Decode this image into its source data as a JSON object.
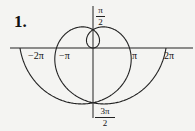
{
  "problem_number": "1.",
  "diagram": {
    "type": "polar-curve",
    "curve": "r = theta",
    "theta_range": [
      "-2π",
      "2π"
    ],
    "axes": {
      "horizontal_labels": [
        "−2π",
        "−π",
        "π",
        "2π"
      ],
      "top_label": {
        "num": "π",
        "den": "2"
      },
      "bottom_label": {
        "num": "3π",
        "den": "2"
      }
    },
    "stroke_color": "#222222",
    "background": "#f4f4f2"
  }
}
